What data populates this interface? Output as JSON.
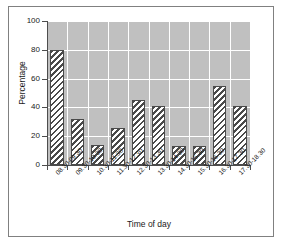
{
  "chart_data": {
    "type": "bar",
    "title": "",
    "xlabel": "Time of day",
    "ylabel": "Percentage",
    "categories": [
      "08.30-09.30",
      "09.30-10.30",
      "10.30-11.30",
      "11.30-12.30",
      "12.30-13.30",
      "13.30-14.30",
      "14.30-15.30",
      "15.30-16.30",
      "16.30-17.30",
      "17.30-18.30"
    ],
    "values": [
      80,
      32,
      14,
      26,
      45,
      41,
      13,
      13,
      55,
      41
    ],
    "ylim": [
      0,
      100
    ],
    "yticks": [
      0,
      20,
      40,
      60,
      80,
      100
    ],
    "ytick_labels": [
      "0",
      "20",
      "40",
      "60",
      "80",
      "100"
    ],
    "grid": true,
    "legend": "none",
    "plot_background": "#c0c0c0",
    "gridline_color": "#ffffff",
    "bar_edge_color": "#4a4a4a",
    "bar_fill": "hatch-diagonal"
  },
  "axis": {
    "x_title": "Time of day",
    "y_title": "Percentage"
  }
}
